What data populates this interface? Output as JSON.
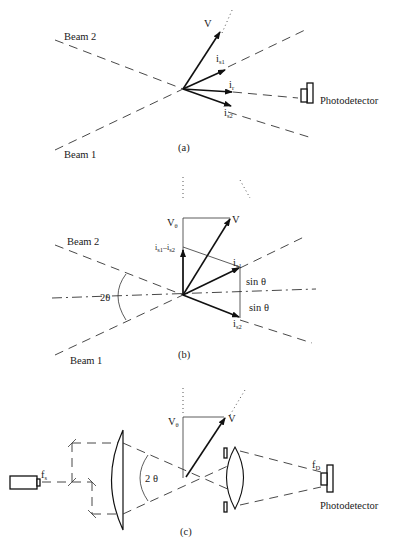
{
  "figure": {
    "panels": [
      {
        "id": "a",
        "caption": "(a)",
        "labels": {
          "beam2": "Beam 2",
          "beam1": "Beam 1",
          "velocity": "V",
          "is1": "i",
          "is1_sub": "s1",
          "ir": "i",
          "ir_sub": "r",
          "is2": "i",
          "is2_sub": "s2",
          "detector": "Photodetector"
        }
      },
      {
        "id": "b",
        "caption": "(b)",
        "labels": {
          "beam2": "Beam 2",
          "beam1": "Beam 1",
          "velocity": "V",
          "v_theta": "V",
          "v_theta_sub": "θ",
          "diff_vector": "i",
          "diff_sub1": "s1",
          "diff_minus": "–",
          "diff_i2": "i",
          "diff_sub2": "s2",
          "is1": "i",
          "is1_sub": "s1",
          "is2": "i",
          "is2_sub": "s2",
          "sin_top": "sin θ",
          "sin_bottom": "sin θ",
          "angle": "2θ"
        }
      },
      {
        "id": "c",
        "caption": "(c)",
        "labels": {
          "laser_freq": "f",
          "laser_freq_sub": "s",
          "v_theta": "V",
          "v_theta_sub": "θ",
          "velocity": "V",
          "angle": "2 θ",
          "detector_freq": "f",
          "detector_freq_sub": "D",
          "detector": "Photodetector"
        }
      }
    ],
    "colors": {
      "ink": "#111111",
      "background": "#ffffff"
    }
  }
}
